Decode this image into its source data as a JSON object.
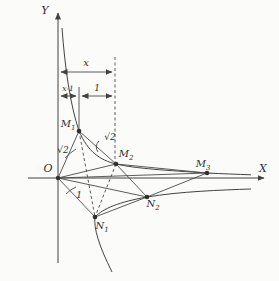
{
  "palette": {
    "paper": "#fbfbf9",
    "ink": "#424242",
    "label": "#2f2f2f"
  },
  "axes": {
    "x_label": "X",
    "y_label": "Y",
    "origin_label": "O"
  },
  "dimension_labels": {
    "x_span": "x",
    "x_minus_one_span": "x-1",
    "one_span": "1"
  },
  "measure_labels": [
    {
      "id": "sqrt2-on-OM1",
      "text": "√2",
      "x": 63,
      "y": 153
    },
    {
      "id": "sqrt2-on-M1M2",
      "text": "√2",
      "x": 110,
      "y": 140
    },
    {
      "id": "one-on-ON1",
      "text": "1",
      "x": 79,
      "y": 198
    }
  ],
  "points": [
    {
      "id": "M1",
      "label": "M",
      "sub": "1",
      "x": 79,
      "y": 131,
      "lx": 68,
      "ly": 127,
      "anchor": "middle"
    },
    {
      "id": "M2",
      "label": "M",
      "sub": "2",
      "x": 116,
      "y": 164,
      "lx": 126,
      "ly": 157,
      "anchor": "middle"
    },
    {
      "id": "M3",
      "label": "M",
      "sub": "3",
      "x": 207,
      "y": 173,
      "lx": 203,
      "ly": 167,
      "anchor": "middle"
    },
    {
      "id": "N1",
      "label": "N",
      "sub": "1",
      "x": 95,
      "y": 217,
      "lx": 102,
      "ly": 229,
      "anchor": "middle"
    },
    {
      "id": "N2",
      "label": "N",
      "sub": "2",
      "x": 147,
      "y": 197,
      "lx": 153,
      "ly": 207,
      "anchor": "middle"
    }
  ],
  "origin_point": {
    "x": 58,
    "y": 178
  }
}
